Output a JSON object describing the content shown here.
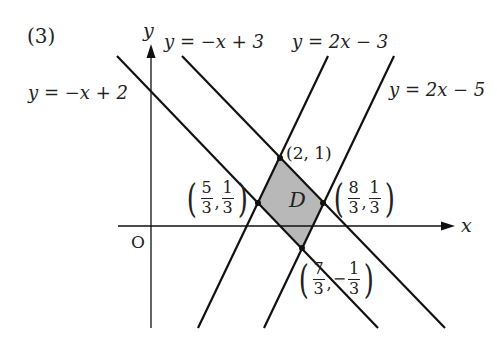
{
  "problem_label": "(3)",
  "axes": {
    "x_label": "x",
    "y_label": "y",
    "origin_label": "O"
  },
  "lines": [
    {
      "id": "l1",
      "equation": "y = −x + 2",
      "slope": -1,
      "intercept": 2
    },
    {
      "id": "l2",
      "equation": "y = −x + 3",
      "slope": -1,
      "intercept": 3
    },
    {
      "id": "l3",
      "equation": "y = 2x − 3",
      "slope": 2,
      "intercept": -3
    },
    {
      "id": "l4",
      "equation": "y = 2x − 5",
      "slope": 2,
      "intercept": -5
    }
  ],
  "region": {
    "label": "D",
    "fill": "#b8b8b8",
    "vertices": [
      {
        "name": "A",
        "x": 2,
        "y": 1,
        "label": "(2, 1)"
      },
      {
        "name": "B",
        "x": "8/3",
        "y": "1/3",
        "x_num": "8",
        "x_den": "3",
        "y_num": "1",
        "y_den": "3",
        "y_neg": ""
      },
      {
        "name": "C",
        "x": "7/3",
        "y": "-1/3",
        "x_num": "7",
        "x_den": "3",
        "y_num": "1",
        "y_den": "3",
        "y_neg": "−"
      },
      {
        "name": "E",
        "x": "5/3",
        "y": "1/3",
        "x_num": "5",
        "x_den": "3",
        "y_num": "1",
        "y_den": "3",
        "y_neg": ""
      }
    ]
  },
  "colors": {
    "line": "#111111",
    "text": "#222222",
    "region_fill": "#b8b8b8"
  }
}
